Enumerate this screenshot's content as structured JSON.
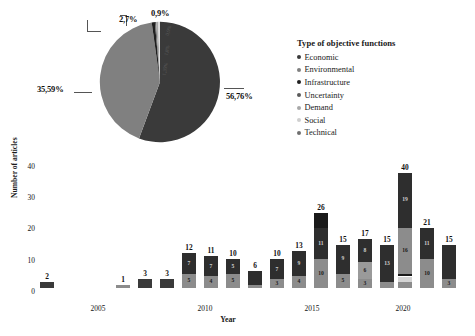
{
  "chart_data": [
    {
      "type": "pie",
      "title": "Type of objective functions",
      "labels": [
        "Economic",
        "Environmental",
        "Infrastructure",
        "Uncertainty",
        "Demand",
        "Social",
        "Technical"
      ],
      "values": [
        56.76,
        35.59,
        2.7,
        0.9,
        1.8,
        1.35,
        0.9
      ],
      "value_labels": [
        "56,76%",
        "35,59%",
        "2,7%",
        "0,9%",
        "1,8%",
        "1,35%",
        "0,9%"
      ],
      "callout_labels": [
        "56,76%",
        "35,59%",
        "2,7%",
        "0,9%"
      ],
      "faint_inner_labels": [
        "0,9%",
        "1,8%",
        "1,35%"
      ],
      "colors": [
        "#3a3a3a",
        "#808080",
        "#1f1f1f",
        "#5a5a5a",
        "#a8a8a8",
        "#d9d9d9",
        "#efefef"
      ],
      "legend_position": "right",
      "legend_title": "Type of objective functions"
    },
    {
      "type": "bar",
      "stacked": true,
      "xlabel": "Year",
      "ylabel": "Number of articles",
      "ylim": [
        0,
        44
      ],
      "yticks": [
        0,
        10,
        20,
        30,
        40
      ],
      "xticks": [
        "2005",
        "2010",
        "2015",
        "2020"
      ],
      "grid": false,
      "categories": [
        "2003",
        "2004",
        "2005",
        "2006",
        "2007",
        "2008",
        "2009",
        "2010",
        "2011",
        "2012",
        "2013",
        "2014",
        "2015",
        "2016",
        "2017",
        "2018",
        "2019",
        "2020",
        "2021",
        "2022"
      ],
      "totals": [
        null,
        2,
        null,
        null,
        1,
        3,
        3,
        12,
        11,
        10,
        6,
        10,
        13,
        26,
        15,
        17,
        15,
        40,
        21,
        15
      ],
      "bars": [
        {
          "total": 2,
          "segments": [
            {
              "value": 2,
              "color": "#3a3a3a",
              "label": ""
            }
          ]
        },
        {
          "total": 1,
          "segments": [
            {
              "value": 1,
              "color": "#8c8c8c",
              "label": ""
            }
          ]
        },
        {
          "total": 3,
          "segments": [
            {
              "value": 3,
              "color": "#3a3a3a",
              "label": ""
            }
          ]
        },
        {
          "total": 3,
          "segments": [
            {
              "value": 3,
              "color": "#3a3a3a",
              "label": ""
            }
          ]
        },
        {
          "total": 12,
          "segments": [
            {
              "value": 5,
              "color": "#8c8c8c",
              "label": "5"
            },
            {
              "value": 7,
              "color": "#2e2e2e",
              "label": "7"
            }
          ]
        },
        {
          "total": 11,
          "segments": [
            {
              "value": 4,
              "color": "#8c8c8c",
              "label": "4"
            },
            {
              "value": 7,
              "color": "#2e2e2e",
              "label": "7"
            }
          ]
        },
        {
          "total": 10,
          "segments": [
            {
              "value": 5,
              "color": "#8c8c8c",
              "label": "5"
            },
            {
              "value": 5,
              "color": "#2e2e2e",
              "label": "5"
            }
          ]
        },
        {
          "total": 6,
          "segments": [
            {
              "value": 1,
              "color": "#8c8c8c",
              "label": ""
            },
            {
              "value": 5,
              "color": "#2e2e2e",
              "label": ""
            }
          ]
        },
        {
          "total": 10,
          "segments": [
            {
              "value": 3,
              "color": "#8c8c8c",
              "label": "3"
            },
            {
              "value": 7,
              "color": "#2e2e2e",
              "label": "7"
            }
          ]
        },
        {
          "total": 13,
          "segments": [
            {
              "value": 4,
              "color": "#8c8c8c",
              "label": "4"
            },
            {
              "value": 9,
              "color": "#2e2e2e",
              "label": "9"
            }
          ]
        },
        {
          "total": 26,
          "segments": [
            {
              "value": 10,
              "color": "#8c8c8c",
              "label": "10"
            },
            {
              "value": 11,
              "color": "#2e2e2e",
              "label": "11"
            },
            {
              "value": 5,
              "color": "#1a1a1a",
              "label": ""
            }
          ]
        },
        {
          "total": 15,
          "segments": [
            {
              "value": 5,
              "color": "#8c8c8c",
              "label": "5"
            },
            {
              "value": 10,
              "color": "#2e2e2e",
              "label": "9"
            }
          ]
        },
        {
          "total": 17,
          "segments": [
            {
              "value": 3,
              "color": "#8c8c8c",
              "label": "3"
            },
            {
              "value": 6,
              "color": "#9a9a9a",
              "label": "6"
            },
            {
              "value": 8,
              "color": "#2e2e2e",
              "label": "8"
            }
          ]
        },
        {
          "total": 15,
          "segments": [
            {
              "value": 2,
              "color": "#8c8c8c",
              "label": ""
            },
            {
              "value": 13,
              "color": "#2e2e2e",
              "label": "13"
            }
          ]
        },
        {
          "total": 40,
          "segments": [
            {
              "value": 2,
              "color": "#8c8c8c",
              "label": ""
            },
            {
              "value": 2,
              "color": "#d4d4d4",
              "label": ""
            },
            {
              "value": 1,
              "color": "#1a1a1a",
              "label": ""
            },
            {
              "value": 16,
              "color": "#8c8c8c",
              "label": "16"
            },
            {
              "value": 19,
              "color": "#2e2e2e",
              "label": "19"
            }
          ]
        },
        {
          "total": 21,
          "segments": [
            {
              "value": 10,
              "color": "#8c8c8c",
              "label": "10"
            },
            {
              "value": 11,
              "color": "#2e2e2e",
              "label": "11"
            }
          ]
        },
        {
          "total": 15,
          "segments": [
            {
              "value": 3,
              "color": "#8c8c8c",
              "label": "3"
            },
            {
              "value": 12,
              "color": "#2e2e2e",
              "label": ""
            }
          ]
        }
      ]
    }
  ],
  "pie": {
    "label_5676": "56,76%",
    "label_3559": "35,59%",
    "label_27": "2,7%",
    "label_09": "0,9%",
    "inner_1": "0,9%",
    "inner_2": "1,8%",
    "inner_3": "1,35%"
  },
  "legend": {
    "title": "Type of objective functions",
    "items": [
      {
        "label": "Economic",
        "color": "#3a3a3a"
      },
      {
        "label": "Environmental",
        "color": "#808080"
      },
      {
        "label": "Infrastructure",
        "color": "#1f1f1f"
      },
      {
        "label": "Uncertainty",
        "color": "#5a5a5a"
      },
      {
        "label": "Demand",
        "color": "#a8a8a8"
      },
      {
        "label": "Social",
        "color": "#cfcfcf"
      },
      {
        "label": "Technical",
        "color": "#6f6f6f"
      }
    ]
  },
  "bar_axis": {
    "ylabel": "Number of articles",
    "xlabel": "Year",
    "yticks": [
      "40",
      "30",
      "20",
      "10",
      "0"
    ],
    "xticks": [
      "2005",
      "2010",
      "2015",
      "2020"
    ]
  }
}
